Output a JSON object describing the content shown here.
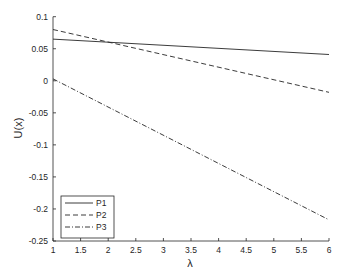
{
  "chart_data": {
    "type": "line",
    "title": "",
    "xlabel": "λ",
    "ylabel": "U(x)",
    "xlim": [
      1,
      6
    ],
    "ylim": [
      -0.25,
      0.1
    ],
    "grid": false,
    "legend_position": "lower left",
    "x_ticks": [
      1,
      1.5,
      2,
      2.5,
      3,
      3.5,
      4,
      4.5,
      5,
      5.5,
      6
    ],
    "x_tick_labels": [
      "1",
      "1.5",
      "2",
      "2.5",
      "3",
      "3.5",
      "4",
      "4.5",
      "5",
      "5.5",
      "6"
    ],
    "y_ticks": [
      0.1,
      0.05,
      0,
      -0.05,
      -0.1,
      -0.15,
      -0.2,
      -0.25
    ],
    "y_tick_labels": [
      "0.1",
      "0.05",
      "0",
      "-0.05",
      "-0.1",
      "-0.15",
      "-0.2",
      "-0.25"
    ],
    "x": [
      1,
      6
    ],
    "series": [
      {
        "name": "P1",
        "style": "solid",
        "values": [
          0.065,
          0.041
        ]
      },
      {
        "name": "P2",
        "style": "dashed",
        "values": [
          0.08,
          -0.018
        ]
      },
      {
        "name": "P3",
        "style": "dashdot",
        "values": [
          0.003,
          -0.217
        ]
      }
    ]
  },
  "colors": {
    "line": "#262626",
    "axis": "#262626",
    "background": "#ffffff"
  }
}
